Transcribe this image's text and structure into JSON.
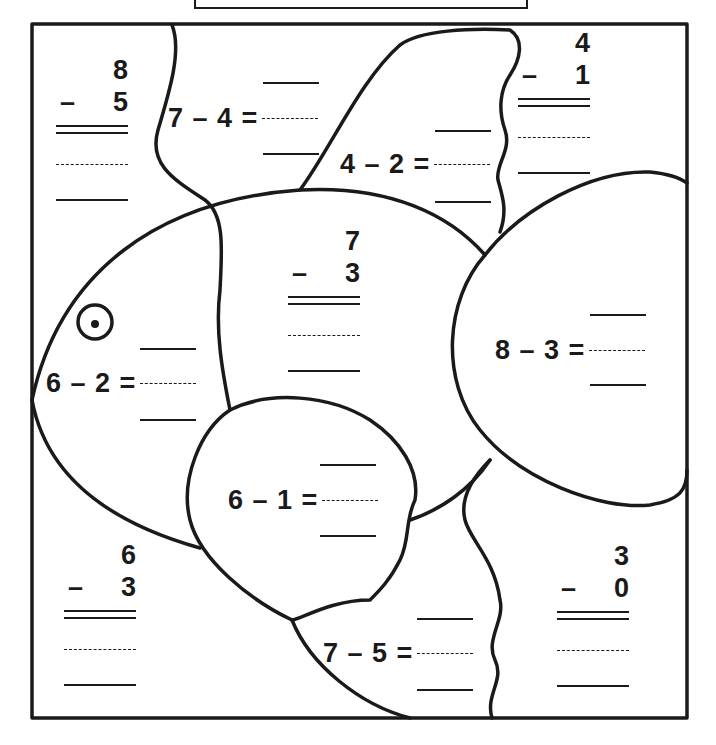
{
  "worksheet": {
    "type": "subtraction fish picture",
    "colors": {
      "ink": "#1a1a1a",
      "paper": "#ffffff"
    },
    "vertical_problems": [
      {
        "id": "top-left",
        "top": "8",
        "minus": "–",
        "bottom": "5"
      },
      {
        "id": "top-right",
        "top": "4",
        "minus": "–",
        "bottom": "1"
      },
      {
        "id": "body-center",
        "top": "7",
        "minus": "–",
        "bottom": "3"
      },
      {
        "id": "bottom-left",
        "top": "6",
        "minus": "–",
        "bottom": "3"
      },
      {
        "id": "bottom-right",
        "top": "3",
        "minus": "–",
        "bottom": "0"
      }
    ],
    "horizontal_problems": [
      {
        "id": "top-fin-left",
        "text": "7 – 4 ="
      },
      {
        "id": "top-fin",
        "text": "4 – 2 ="
      },
      {
        "id": "head",
        "text": "6 – 2 ="
      },
      {
        "id": "tail",
        "text": "8 – 3 ="
      },
      {
        "id": "side-fin",
        "text": "6 – 1 ="
      },
      {
        "id": "bottom-fin",
        "text": "7 – 5 ="
      }
    ]
  }
}
